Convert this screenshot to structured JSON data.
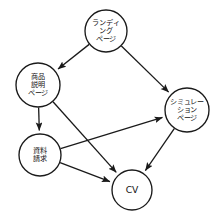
{
  "diagram": {
    "type": "flow-graph",
    "title": "",
    "background_color": "#ffffff",
    "stroke_color": "#1a1a1a",
    "nodes": [
      {
        "id": "landing",
        "name": "landing-page-node",
        "lines": [
          "ランディ",
          "ング",
          "ページ"
        ],
        "cx": 106,
        "cy": 31,
        "r": 21
      },
      {
        "id": "product",
        "name": "product-description-page-node",
        "lines": [
          "商品",
          "説明",
          "ページ"
        ],
        "cx": 38,
        "cy": 85,
        "r": 22
      },
      {
        "id": "simulation",
        "name": "simulation-page-node",
        "lines": [
          "シミュレー",
          "ション",
          "ページ"
        ],
        "cx": 187,
        "cy": 110,
        "r": 22
      },
      {
        "id": "request",
        "name": "document-request-node",
        "lines": [
          "資料",
          "請求"
        ],
        "cx": 40,
        "cy": 155,
        "r": 21
      },
      {
        "id": "cv",
        "name": "cv-node",
        "lines": [
          "CV"
        ],
        "cx": 132,
        "cy": 190,
        "r": 20
      }
    ],
    "edges": [
      {
        "id": "landing-to-product",
        "from": "landing",
        "to": "product",
        "directed": true
      },
      {
        "id": "landing-to-simulation",
        "from": "landing",
        "to": "simulation",
        "directed": true
      },
      {
        "id": "product-to-request",
        "from": "product",
        "to": "request",
        "directed": true
      },
      {
        "id": "product-to-cv",
        "from": "product",
        "to": "cv",
        "directed": true
      },
      {
        "id": "request-to-simulation",
        "from": "request",
        "to": "simulation",
        "directed": true
      },
      {
        "id": "request-to-cv",
        "from": "request",
        "to": "cv",
        "directed": true
      },
      {
        "id": "simulation-to-cv",
        "from": "simulation",
        "to": "cv",
        "directed": true
      }
    ]
  }
}
